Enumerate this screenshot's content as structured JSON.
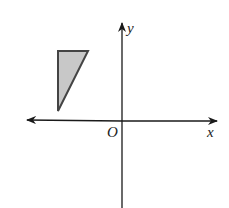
{
  "figure": {
    "type": "coordinate-plane",
    "labels": {
      "x_axis": "x",
      "y_axis": "y",
      "origin": "O"
    },
    "colors": {
      "axis": "#1a1a1a",
      "triangle_fill": "#c8c8c8",
      "triangle_stroke": "#444444"
    },
    "shape": {
      "name": "right triangle",
      "quadrant": "II",
      "vertices_px": [
        [
          58,
          51
        ],
        [
          88,
          51
        ],
        [
          58,
          111
        ]
      ]
    }
  }
}
